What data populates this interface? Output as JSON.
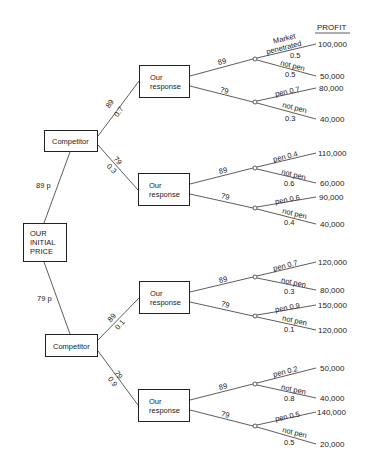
{
  "root": {
    "label_lines": [
      "OUR",
      "INITIAL",
      "PRICE"
    ]
  },
  "root_branches": [
    {
      "price": "89 p"
    },
    {
      "price": "79 p"
    }
  ],
  "competitor_label": "Competitor",
  "response_label_lines": [
    "Our",
    "response"
  ],
  "header": {
    "profit": "PROFIT"
  },
  "competitors": [
    {
      "branches": [
        {
          "price": "89",
          "prob": "0.7"
        },
        {
          "price": "79",
          "prob": "0.3"
        }
      ]
    },
    {
      "branches": [
        {
          "price": "89",
          "prob": "0.1"
        },
        {
          "price": "79",
          "prob": "0.9"
        }
      ]
    }
  ],
  "responses": [
    {
      "options": [
        {
          "price": "89",
          "pen_label": "Market penetrated",
          "pen_prob": "0.5",
          "pen_profit": "100,000",
          "notpen_label": "not pen",
          "notpen_prob": "0.5",
          "notpen_profit": "50,000"
        },
        {
          "price": "79",
          "pen_label": "pen 0.7",
          "pen_profit": "80,000",
          "notpen_label": "not pen",
          "notpen_prob": "0.3",
          "notpen_profit": "40,000"
        }
      ]
    },
    {
      "options": [
        {
          "price": "89",
          "pen_label": "pen 0.4",
          "pen_profit": "110,000",
          "notpen_label": "not pen",
          "notpen_prob": "0.6",
          "notpen_profit": "60,000"
        },
        {
          "price": "79",
          "pen_label": "pen 0.6",
          "pen_profit": "90,000",
          "notpen_label": "not pen",
          "notpen_prob": "0.4",
          "notpen_profit": "40,000"
        }
      ]
    },
    {
      "options": [
        {
          "price": "89",
          "pen_label": "pen 0.7",
          "pen_profit": "120,000",
          "notpen_label": "not pen",
          "notpen_prob": "0.3",
          "notpen_profit": "80,000"
        },
        {
          "price": "79",
          "pen_label": "pen 0.9",
          "pen_profit": "150,000",
          "notpen_label": "not pen",
          "notpen_prob": "0.1",
          "notpen_profit": "120,000"
        }
      ]
    },
    {
      "options": [
        {
          "price": "89",
          "pen_label": "pen 0.2",
          "pen_profit": "50,000",
          "notpen_label": "not pen",
          "notpen_prob": "0.8",
          "notpen_profit": "40,000"
        },
        {
          "price": "79",
          "pen_label": "pen 0.5",
          "pen_profit": "140,000",
          "notpen_label": "not pen",
          "notpen_prob": "0.5",
          "notpen_profit": "20,000"
        }
      ]
    }
  ],
  "market_label_lines": [
    "Market",
    "penetrated"
  ]
}
